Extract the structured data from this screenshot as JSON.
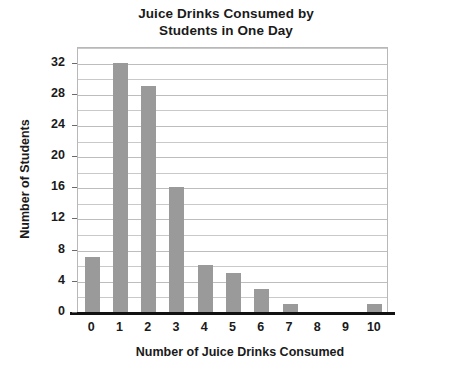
{
  "chart_data": {
    "type": "bar",
    "title": "Juice Drinks Consumed by Students in One Day",
    "title_line1": "Juice Drinks Consumed by",
    "title_line2": "Students in One Day",
    "xlabel": "Number of Juice Drinks Consumed",
    "ylabel": "Number of Students",
    "categories": [
      "0",
      "1",
      "2",
      "3",
      "4",
      "5",
      "6",
      "7",
      "8",
      "9",
      "10"
    ],
    "values": [
      7,
      32,
      29,
      16,
      6,
      5,
      3,
      1,
      0,
      0,
      1
    ],
    "ylim": [
      0,
      34
    ],
    "ytick_labels": [
      "0",
      "4",
      "8",
      "12",
      "16",
      "20",
      "24",
      "28",
      "32"
    ],
    "ytick_values": [
      0,
      4,
      8,
      12,
      16,
      20,
      24,
      28,
      32
    ],
    "minor_gridline_values": [
      2,
      4,
      6,
      8,
      10,
      12,
      14,
      16,
      18,
      20,
      22,
      24,
      26,
      28,
      30,
      32,
      34
    ],
    "grid": true,
    "grid_axis": "y",
    "legend": false,
    "bar_color": "#9a9a9a",
    "grid_color": "#c9c9c9",
    "axis_color": "#111111",
    "text_color": "#1a1a1a",
    "background_color": "#ffffff"
  }
}
